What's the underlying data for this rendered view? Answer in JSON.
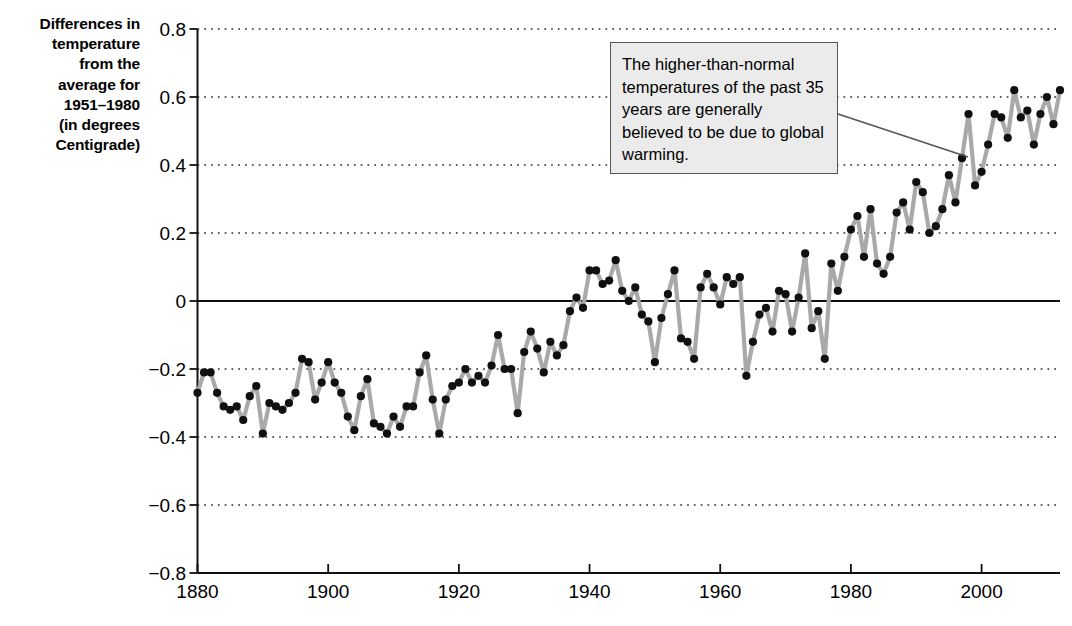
{
  "chart_data": {
    "type": "line",
    "title": "",
    "xlabel": "",
    "ylabel": "Differences in temperature from the average for 1951–1980 (in degrees Centigrade)",
    "xlim": [
      1880,
      2012
    ],
    "ylim": [
      -0.8,
      0.8
    ],
    "grid": true,
    "legend": "none",
    "marker": "filled-circle",
    "line_color": "#a9a9a9",
    "marker_color": "#101010",
    "zero_line": 0,
    "x_ticks": [
      1880,
      1900,
      1920,
      1940,
      1960,
      1980,
      2000
    ],
    "x_tick_labels": [
      "1880",
      "1900",
      "1920",
      "1940",
      "1960",
      "1980",
      "2000"
    ],
    "y_ticks": [
      0.8,
      0.6,
      0.4,
      0.2,
      0,
      -0.2,
      -0.4,
      -0.6,
      -0.8
    ],
    "y_tick_labels": [
      "0.8",
      "0.6",
      "0.4",
      "0.2",
      "0",
      "−0.2",
      "−0.4",
      "−0.6",
      "−0.8"
    ],
    "x": [
      1880,
      1881,
      1882,
      1883,
      1884,
      1885,
      1886,
      1887,
      1888,
      1889,
      1890,
      1891,
      1892,
      1893,
      1894,
      1895,
      1896,
      1897,
      1898,
      1899,
      1900,
      1901,
      1902,
      1903,
      1904,
      1905,
      1906,
      1907,
      1908,
      1909,
      1910,
      1911,
      1912,
      1913,
      1914,
      1915,
      1916,
      1917,
      1918,
      1919,
      1920,
      1921,
      1922,
      1923,
      1924,
      1925,
      1926,
      1927,
      1928,
      1929,
      1930,
      1931,
      1932,
      1933,
      1934,
      1935,
      1936,
      1937,
      1938,
      1939,
      1940,
      1941,
      1942,
      1943,
      1944,
      1945,
      1946,
      1947,
      1948,
      1949,
      1950,
      1951,
      1952,
      1953,
      1954,
      1955,
      1956,
      1957,
      1958,
      1959,
      1960,
      1961,
      1962,
      1963,
      1964,
      1965,
      1966,
      1967,
      1968,
      1969,
      1970,
      1971,
      1972,
      1973,
      1974,
      1975,
      1976,
      1977,
      1978,
      1979,
      1980,
      1981,
      1982,
      1983,
      1984,
      1985,
      1986,
      1987,
      1988,
      1989,
      1990,
      1991,
      1992,
      1993,
      1994,
      1995,
      1996,
      1997,
      1998,
      1999,
      2000,
      2001,
      2002,
      2003,
      2004,
      2005,
      2006,
      2007,
      2008,
      2009,
      2010,
      2011,
      2012
    ],
    "values": [
      -0.27,
      -0.21,
      -0.21,
      -0.27,
      -0.31,
      -0.32,
      -0.31,
      -0.35,
      -0.28,
      -0.25,
      -0.39,
      -0.3,
      -0.31,
      -0.32,
      -0.3,
      -0.27,
      -0.17,
      -0.18,
      -0.29,
      -0.24,
      -0.18,
      -0.24,
      -0.27,
      -0.34,
      -0.38,
      -0.28,
      -0.23,
      -0.36,
      -0.37,
      -0.39,
      -0.34,
      -0.37,
      -0.31,
      -0.31,
      -0.21,
      -0.16,
      -0.29,
      -0.39,
      -0.29,
      -0.25,
      -0.24,
      -0.2,
      -0.24,
      -0.22,
      -0.24,
      -0.19,
      -0.1,
      -0.2,
      -0.2,
      -0.33,
      -0.15,
      -0.09,
      -0.14,
      -0.21,
      -0.12,
      -0.16,
      -0.13,
      -0.03,
      0.01,
      -0.02,
      0.09,
      0.09,
      0.05,
      0.06,
      0.12,
      0.03,
      0.0,
      0.04,
      -0.04,
      -0.06,
      -0.18,
      -0.05,
      0.02,
      0.09,
      -0.11,
      -0.12,
      -0.17,
      0.04,
      0.08,
      0.04,
      -0.01,
      0.07,
      0.05,
      0.07,
      -0.22,
      -0.12,
      -0.04,
      -0.02,
      -0.09,
      0.03,
      0.02,
      -0.09,
      0.01,
      0.14,
      -0.08,
      -0.03,
      -0.17,
      0.11,
      0.03,
      0.13,
      0.21,
      0.25,
      0.13,
      0.27,
      0.11,
      0.08,
      0.13,
      0.26,
      0.29,
      0.21,
      0.35,
      0.32,
      0.2,
      0.22,
      0.27,
      0.37,
      0.29,
      0.42,
      0.55,
      0.34,
      0.38,
      0.46,
      0.55,
      0.54,
      0.48,
      0.62,
      0.54,
      0.56,
      0.46,
      0.55,
      0.6,
      0.52,
      0.62
    ]
  },
  "y_axis_caption": [
    "Differences in",
    "temperature",
    "from the",
    "average for",
    "1951–1980",
    "(in degrees",
    "Centigrade)"
  ],
  "callout": {
    "text": "The higher-than-normal temperatures of the past 35 years are generally believed to be due to global warming.",
    "background": "#ebebeb",
    "border_color": "#555555"
  }
}
